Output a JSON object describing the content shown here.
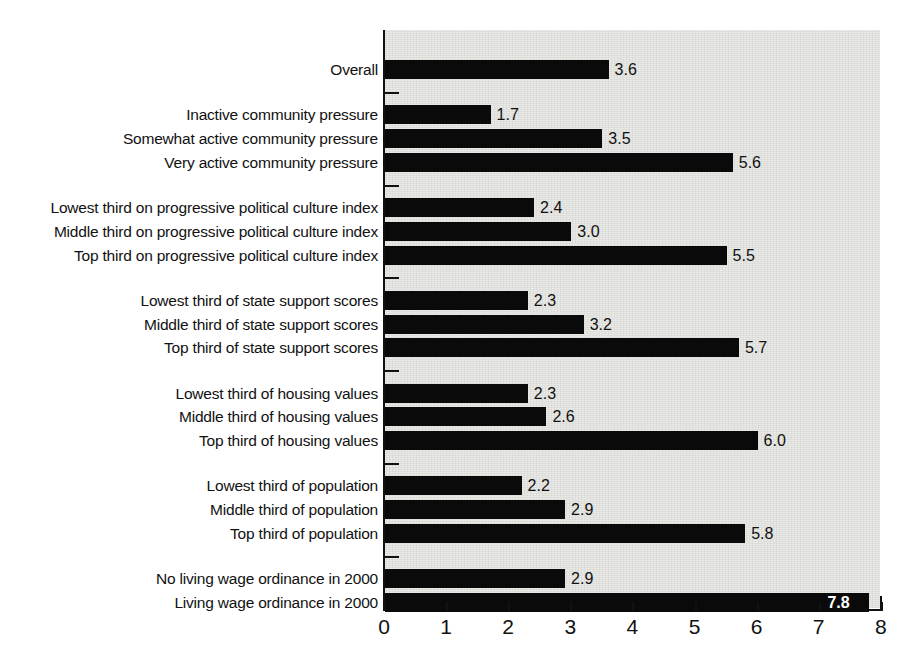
{
  "chart_data": {
    "type": "bar",
    "orientation": "horizontal",
    "title": "",
    "subtitle": "",
    "xlabel": "",
    "ylabel": "",
    "xlim": [
      0,
      8
    ],
    "xticks": [
      0,
      1,
      2,
      3,
      4,
      5,
      6,
      7,
      8
    ],
    "xtick_labels": [
      "0",
      "1",
      "2",
      "3",
      "4",
      "5",
      "6",
      "7",
      "8"
    ],
    "grid": false,
    "legend": null,
    "bar_color": "#0a0a0a",
    "plot_background": "#e7e7e4",
    "categories": [
      "Overall",
      "Inactive community pressure",
      "Somewhat active community pressure",
      "Very active community pressure",
      "Lowest third on progressive political culture index",
      "Middle third on progressive political culture index",
      "Top third on progressive political culture index",
      "Lowest third of state support scores",
      "Middle third of state support scores",
      "Top third of state support scores",
      "Lowest third of housing values",
      "Middle third of housing values",
      "Top third of housing values",
      "Lowest third of population",
      "Middle third of population",
      "Top third of population",
      "No living wage ordinance in 2000",
      "Living wage ordinance in 2000"
    ],
    "values": [
      3.6,
      1.7,
      3.5,
      5.6,
      2.4,
      3.0,
      5.5,
      2.3,
      3.2,
      5.7,
      2.3,
      2.6,
      6.0,
      2.2,
      2.9,
      5.8,
      2.9,
      7.8
    ],
    "value_labels": [
      "3.6",
      "1.7",
      "3.5",
      "5.6",
      "2.4",
      "3.0",
      "5.5",
      "2.3",
      "3.2",
      "5.7",
      "2.3",
      "2.6",
      "6.0",
      "2.2",
      "2.9",
      "5.8",
      "2.9",
      "7.8"
    ],
    "groups": [
      {
        "name": "overall",
        "indices": [
          0
        ]
      },
      {
        "name": "community-pressure",
        "indices": [
          1,
          2,
          3
        ]
      },
      {
        "name": "progressive-political-culture-index",
        "indices": [
          4,
          5,
          6
        ]
      },
      {
        "name": "state-support-scores",
        "indices": [
          7,
          8,
          9
        ]
      },
      {
        "name": "housing-values",
        "indices": [
          10,
          11,
          12
        ]
      },
      {
        "name": "population",
        "indices": [
          13,
          14,
          15
        ]
      },
      {
        "name": "living-wage-ordinance",
        "indices": [
          16,
          17
        ]
      }
    ]
  },
  "rows": [
    {
      "label": "Overall",
      "value_label": "3.6",
      "value": 3.6,
      "top": 38,
      "inside": false
    },
    {
      "label": "Inactive community pressure",
      "value_label": "1.7",
      "value": 1.7,
      "top": 95,
      "inside": false
    },
    {
      "label": "Somewhat active community pressure",
      "value_label": "3.5",
      "value": 3.5,
      "top": 125,
      "inside": false
    },
    {
      "label": "Very active community pressure",
      "value_label": "5.6",
      "value": 5.6,
      "top": 155,
      "inside": false
    },
    {
      "label": "Lowest third on progressive political culture index",
      "value_label": "2.4",
      "value": 2.4,
      "top": 212,
      "inside": false
    },
    {
      "label": "Middle third on progressive political culture index",
      "value_label": "3.0",
      "value": 3.0,
      "top": 242,
      "inside": false
    },
    {
      "label": "Top third on progressive political culture index",
      "value_label": "5.5",
      "value": 5.5,
      "top": 272,
      "inside": false
    },
    {
      "label": "Lowest third of state support scores",
      "value_label": "2.3",
      "value": 2.3,
      "top": 329,
      "inside": false
    },
    {
      "label": "Middle third of state support scores",
      "value_label": "3.2",
      "value": 3.2,
      "top": 359,
      "inside": false
    },
    {
      "label": "Top third of state support scores",
      "value_label": "5.7",
      "value": 5.7,
      "top": 389,
      "inside": false
    },
    {
      "label": "Lowest third of housing values",
      "value_label": "2.3",
      "value": 2.3,
      "top": 446,
      "inside": false
    },
    {
      "label": "Middle third of housing values",
      "value_label": "2.6",
      "value": 2.6,
      "top": 476,
      "inside": false
    },
    {
      "label": "Top third of housing values",
      "value_label": "6.0",
      "value": 6.0,
      "top": 506,
      "inside": false
    },
    {
      "label": "Lowest third of population",
      "value_label": "2.2",
      "value": 2.2,
      "top": 563,
      "inside": false
    },
    {
      "label": "Middle third of population",
      "value_label": "2.9",
      "value": 2.9,
      "top": 593,
      "inside": false
    },
    {
      "label": "Top third of population",
      "value_label": "5.8",
      "value": 5.8,
      "top": 623,
      "inside": false
    },
    {
      "label": "No living wage ordinance in 2000",
      "value_label": "2.9",
      "value": 2.9,
      "top": 680,
      "inside": false
    },
    {
      "label": "Living wage ordinance in 2000",
      "value_label": "7.8",
      "value": 7.8,
      "top": 710,
      "inside": true
    }
  ],
  "group_ticks": [
    78,
    195,
    312,
    429,
    546,
    663
  ],
  "axis": {
    "ticks": [
      "0",
      "1",
      "2",
      "3",
      "4",
      "5",
      "6",
      "7",
      "8"
    ],
    "origin_x": 384,
    "unit_px": 62.1,
    "baseline_y": 609
  }
}
